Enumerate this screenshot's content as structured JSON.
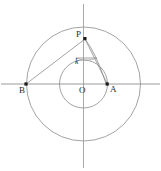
{
  "figure": {
    "background_color": "#ffffff",
    "stroke_color": "#8c8c8c",
    "axis_color": "#9a9a9a",
    "label_color": "#2b2b2b",
    "point_color": "#1a1a1a",
    "labels": {
      "point_p": "P",
      "point_b": "B",
      "point_o": "O",
      "point_a": "A",
      "segment_k": "k"
    },
    "geometry": {
      "center": {
        "x": 83.5,
        "y": 84
      },
      "outer_circle_radius": 57,
      "inner_circle_radius": 24,
      "points": {
        "P": {
          "x": 85,
          "y": 39
        },
        "B": {
          "x": 26,
          "y": 84
        },
        "O": {
          "x": 83.5,
          "y": 84
        },
        "A": {
          "x": 107,
          "y": 84
        }
      },
      "chord": {
        "x1": 76,
        "y1": 58,
        "x2": 97,
        "y2": 58
      },
      "horizontal_axis": {
        "x1": 0,
        "y1": 84,
        "x2": 161,
        "y2": 84
      },
      "vertical_axis": {
        "x1": 83.5,
        "y1": 4,
        "x2": 83.5,
        "y2": 168
      }
    }
  }
}
